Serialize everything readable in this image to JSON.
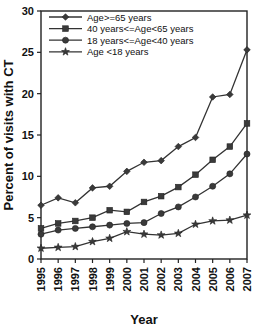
{
  "chart_data": {
    "type": "line",
    "title": "",
    "xlabel": "Year",
    "ylabel": "Percent of visits with CT",
    "categories": [
      "1995",
      "1996",
      "1997",
      "1998",
      "1999",
      "2000",
      "2001",
      "2002",
      "2003",
      "2004",
      "2005",
      "2006",
      "2007"
    ],
    "x": [
      1995,
      1996,
      1997,
      1998,
      1999,
      2000,
      2001,
      2002,
      2003,
      2004,
      2005,
      2006,
      2007
    ],
    "xlim": [
      1995,
      2007
    ],
    "ylim": [
      0,
      30
    ],
    "yticks": [
      0,
      5,
      10,
      15,
      20,
      25,
      30
    ],
    "grid": false,
    "legend_position": "top-left",
    "series": [
      {
        "name": "Age>=65 years",
        "marker": "diamond",
        "values": [
          6.5,
          7.4,
          6.8,
          8.6,
          8.8,
          10.6,
          11.7,
          11.9,
          13.6,
          14.7,
          19.6,
          19.9,
          25.3
        ]
      },
      {
        "name": "40 years<=Age<65 years",
        "marker": "square",
        "values": [
          3.7,
          4.3,
          4.6,
          5.0,
          5.9,
          5.7,
          6.9,
          7.6,
          8.7,
          10.2,
          12.0,
          13.6,
          16.4
        ]
      },
      {
        "name": "18 years<=Age<40 years",
        "marker": "circle",
        "values": [
          3.0,
          3.5,
          3.7,
          3.9,
          4.1,
          4.3,
          4.4,
          5.5,
          6.3,
          7.5,
          8.8,
          10.3,
          12.7
        ]
      },
      {
        "name": "Age <18 years",
        "marker": "star",
        "values": [
          1.3,
          1.4,
          1.5,
          2.1,
          2.5,
          3.3,
          3.0,
          2.9,
          3.1,
          4.2,
          4.6,
          4.7,
          5.3
        ]
      }
    ]
  },
  "axes": {
    "ylabel": "Percent of visits with CT",
    "xlabel": "Year"
  }
}
